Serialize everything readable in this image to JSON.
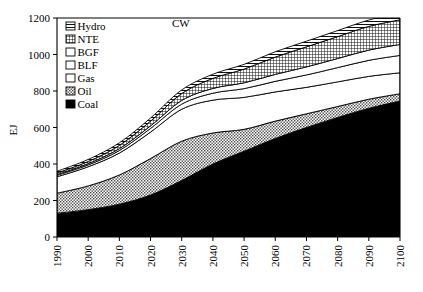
{
  "chart_data": {
    "type": "area",
    "title": "CW",
    "xlabel": "",
    "ylabel": "EJ",
    "xlim": [
      1990,
      2100
    ],
    "ylim": [
      0,
      1200
    ],
    "grid": false,
    "legend_position": "top-left-inside",
    "stacked": true,
    "x": [
      1990,
      2000,
      2010,
      2020,
      2030,
      2040,
      2050,
      2060,
      2070,
      2080,
      2090,
      2100
    ],
    "xticklabels": [
      "1990",
      "2000",
      "2010",
      "2020",
      "2030",
      "2040",
      "2050",
      "2060",
      "2070",
      "2080",
      "2090",
      "2100"
    ],
    "yticklabels": [
      "0",
      "200",
      "400",
      "600",
      "800",
      "1000",
      "1200"
    ],
    "yticks": [
      0,
      200,
      400,
      600,
      800,
      1000,
      1200
    ],
    "series": [
      {
        "name": "Coal",
        "pattern": "solid-black",
        "values": [
          130,
          150,
          180,
          230,
          310,
          400,
          470,
          540,
          600,
          655,
          705,
          745
        ]
      },
      {
        "name": "Oil",
        "pattern": "fine-dots",
        "values": [
          110,
          130,
          160,
          200,
          215,
          170,
          120,
          95,
          75,
          60,
          50,
          40
        ]
      },
      {
        "name": "Gas",
        "pattern": "white",
        "values": [
          90,
          105,
          120,
          145,
          175,
          180,
          175,
          160,
          145,
          135,
          125,
          115
        ]
      },
      {
        "name": "BLF",
        "pattern": "white",
        "values": [
          8,
          10,
          14,
          20,
          28,
          38,
          48,
          58,
          68,
          78,
          88,
          95
        ]
      },
      {
        "name": "BGF",
        "pattern": "white",
        "values": [
          5,
          7,
          10,
          14,
          20,
          26,
          32,
          38,
          44,
          50,
          56,
          60
        ]
      },
      {
        "name": "NTE",
        "pattern": "grid-hatch",
        "values": [
          8,
          12,
          18,
          26,
          38,
          55,
          75,
          95,
          110,
          120,
          130,
          135
        ]
      },
      {
        "name": "Hydro",
        "pattern": "horiz-lines",
        "values": [
          9,
          11,
          14,
          17,
          20,
          23,
          26,
          29,
          31,
          33,
          35,
          37
        ]
      }
    ],
    "legend": [
      {
        "label": "Hydro",
        "pattern": "horiz-lines"
      },
      {
        "label": "NTE",
        "pattern": "grid-hatch"
      },
      {
        "label": "BGF",
        "pattern": "white"
      },
      {
        "label": "BLF",
        "pattern": "white"
      },
      {
        "label": "Gas",
        "pattern": "white"
      },
      {
        "label": "Oil",
        "pattern": "fine-dots"
      },
      {
        "label": "Coal",
        "pattern": "solid-black"
      }
    ],
    "colors": {
      "line": "#000000",
      "coal": "#000000",
      "oil": "#b5b5b5",
      "gas": "#ffffff",
      "blf": "#ffffff",
      "bgf": "#ffffff",
      "nte": "#6e6e6e",
      "hydro": "#ffffff",
      "background": "#ffffff"
    }
  }
}
